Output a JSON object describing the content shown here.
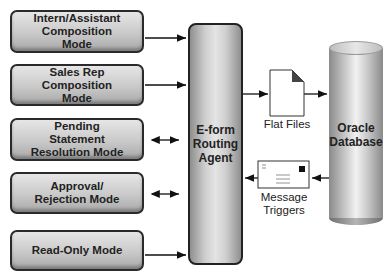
{
  "modes": [
    {
      "label": "Intern/Assistant\nComposition\nMode",
      "connection": "to-agent"
    },
    {
      "label": "Sales Rep\nComposition\nMode",
      "connection": "to-agent"
    },
    {
      "label": "Pending\nStatement\nResolution Mode",
      "connection": "bidirectional"
    },
    {
      "label": "Approval/\nRejection Mode",
      "connection": "bidirectional"
    },
    {
      "label": "Read-Only Mode",
      "connection": "to-agent"
    }
  ],
  "agent": {
    "label": "E-form\nRouting\nAgent"
  },
  "flat_files": {
    "label": "Flat Files",
    "icon": "document-icon"
  },
  "message_triggers": {
    "label": "Message\nTriggers",
    "icon": "envelope-icon"
  },
  "database": {
    "label": "Oracle\nDatabase",
    "icon": "cylinder-database-icon"
  }
}
